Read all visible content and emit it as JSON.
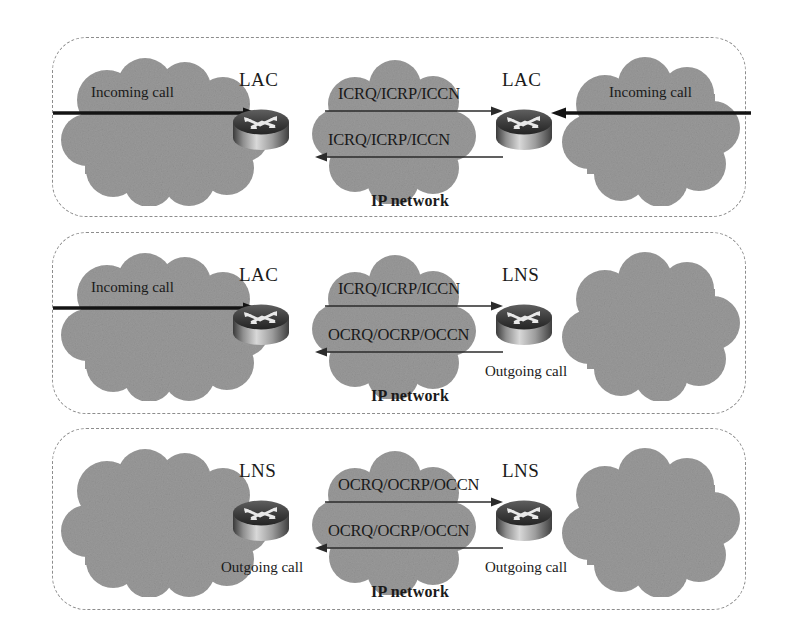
{
  "figure": {
    "type": "network-diagram",
    "title": "",
    "background_color": "#ffffff",
    "cloud_color": "#9a9a9a",
    "line_color": "#1a1a1a",
    "panel_border_color": "#8d8d8d"
  },
  "labels": {
    "ip_network": "IP network",
    "incoming_call": "Incoming call",
    "outgoing_call": "Outgoing call",
    "lac": "LAC",
    "lns": "LNS",
    "icrq": "ICRQ/ICRP/ICCN",
    "ocrq": "OCRQ/OCRP/OCCN"
  },
  "panels": [
    {
      "id": "panel-1",
      "scenario": "LAC to LAC - incoming call both ends",
      "left": {
        "device": "LAC",
        "cloud_label": "Incoming call",
        "cloud_label_visible": true,
        "arrow_visible": true,
        "arrow_direction": "right",
        "below_label": "",
        "below_label_visible": false
      },
      "right": {
        "device": "LAC",
        "cloud_label": "Incoming call",
        "cloud_label_visible": true,
        "arrow_visible": true,
        "arrow_direction": "left",
        "below_label": "",
        "below_label_visible": false
      },
      "center": {
        "network_label": "IP network",
        "top_message": "ICRQ/ICRP/ICCN",
        "top_direction": "right",
        "bottom_message": "ICRQ/ICRP/ICCN",
        "bottom_direction": "left"
      }
    },
    {
      "id": "panel-2",
      "scenario": "LAC to LNS - incoming call in, outgoing call out",
      "left": {
        "device": "LAC",
        "cloud_label": "Incoming call",
        "cloud_label_visible": true,
        "arrow_visible": true,
        "arrow_direction": "right",
        "below_label": "",
        "below_label_visible": false
      },
      "right": {
        "device": "LNS",
        "cloud_label": "",
        "cloud_label_visible": false,
        "arrow_visible": false,
        "arrow_direction": "",
        "below_label": "Outgoing call",
        "below_label_visible": true
      },
      "center": {
        "network_label": "IP network",
        "top_message": "ICRQ/ICRP/ICCN",
        "top_direction": "right",
        "bottom_message": "OCRQ/OCRP/OCCN",
        "bottom_direction": "left"
      }
    },
    {
      "id": "panel-3",
      "scenario": "LNS to LNS - outgoing call both ends",
      "left": {
        "device": "LNS",
        "cloud_label": "",
        "cloud_label_visible": false,
        "arrow_visible": false,
        "arrow_direction": "",
        "below_label": "Outgoing call",
        "below_label_visible": true
      },
      "right": {
        "device": "LNS",
        "cloud_label": "",
        "cloud_label_visible": false,
        "arrow_visible": false,
        "arrow_direction": "",
        "below_label": "Outgoing call",
        "below_label_visible": true
      },
      "center": {
        "network_label": "IP network",
        "top_message": "OCRQ/OCRP/OCCN",
        "top_direction": "right",
        "bottom_message": "OCRQ/OCRP/OCCN",
        "bottom_direction": "left"
      }
    }
  ]
}
